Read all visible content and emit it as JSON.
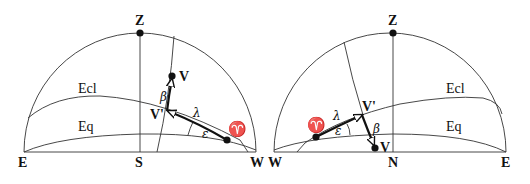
{
  "left_panel": {
    "labels": {
      "zenith": "Z",
      "east": "E",
      "south": "S",
      "west": "W",
      "ecliptic": "Ecl",
      "equator": "Eq",
      "point_v": "V",
      "point_v_prime": "V'",
      "vernal_equinox": "♈",
      "beta": "β",
      "lambda": "λ",
      "epsilon": "ε"
    }
  },
  "right_panel": {
    "labels": {
      "zenith": "Z",
      "west": "W",
      "north": "N",
      "east": "E",
      "ecliptic": "Ecl",
      "equator": "Eq",
      "point_v": "V",
      "point_v_prime": "V'",
      "vernal_equinox": "♈",
      "beta": "β",
      "lambda": "λ",
      "epsilon": "ε"
    }
  }
}
